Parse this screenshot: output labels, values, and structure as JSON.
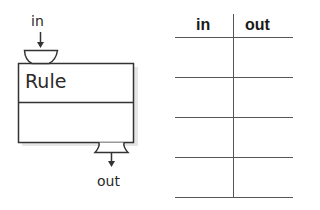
{
  "rule_machine": {
    "input_label": "in",
    "title": "Rule",
    "output_label": "out"
  },
  "table": {
    "headers": [
      "in",
      "out"
    ],
    "rows": [
      {
        "in": "",
        "out": ""
      },
      {
        "in": "",
        "out": ""
      },
      {
        "in": "",
        "out": ""
      },
      {
        "in": "",
        "out": ""
      }
    ]
  },
  "colors": {
    "stroke": "#333333",
    "table_line": "#555555",
    "shadow": "#d8d8d8"
  }
}
